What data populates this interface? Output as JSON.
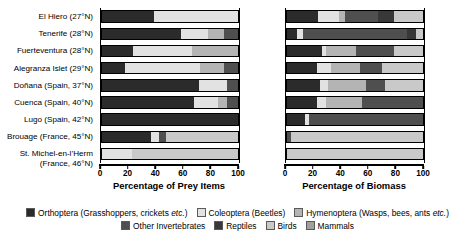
{
  "chart_data": {
    "type": "bar",
    "title": "",
    "subtitle": "",
    "orientation": "horizontal",
    "stacked": true,
    "normalized_percent": true,
    "grid": false,
    "legend_position": "bottom",
    "categories": [
      "El Hiero (27°N)",
      "Tenerife (28°N)",
      "Fuerteventura (28°N)",
      "Alegranza Islet (29°N)",
      "Doñana (Spain, 37°N)",
      "Cuenca (Spain, 40°N)",
      "Lugo (Spain, 42°N)",
      "Brouage (France, 45°N)",
      "St. Michel-en-l’Herm (France, 46°N)"
    ],
    "series_names": [
      "Orthoptera (Grasshoppers, crickets etc.)",
      "Coleoptera (Beetles)",
      "Hymenoptera (Wasps, bees, ants etc.)",
      "Other Invertebrates",
      "Reptiles",
      "Birds",
      "Mammals"
    ],
    "series_colors": [
      "#2b2b2b",
      "#e2e2e2",
      "#b4b4b4",
      "#4f4f4f",
      "#383838",
      "#c9c9c9",
      "#a0a0a0"
    ],
    "panels": [
      {
        "id": "prey-items",
        "xlabel": "Percentage of Prey Items",
        "xlim": [
          0,
          100
        ],
        "xticks": [
          0,
          20,
          40,
          60,
          80,
          100
        ],
        "rows": [
          {
            "category": "El Hiero (27°N)",
            "values": [
              38,
              62,
              0,
              0,
              0,
              0,
              0
            ]
          },
          {
            "category": "Tenerife (28°N)",
            "values": [
              58,
              20,
              12,
              10,
              0,
              0,
              0
            ]
          },
          {
            "category": "Fuerteventura (28°N)",
            "values": [
              23,
              43,
              34,
              0,
              0,
              0,
              0
            ]
          },
          {
            "category": "Alegranza Islet (29°N)",
            "values": [
              17,
              55,
              18,
              10,
              0,
              0,
              0
            ]
          },
          {
            "category": "Doñana (Spain, 37°N)",
            "values": [
              71,
              21,
              0,
              8,
              0,
              0,
              0
            ]
          },
          {
            "category": "Cuenca (Spain, 40°N)",
            "values": [
              68,
              17,
              7,
              8,
              0,
              0,
              0
            ]
          },
          {
            "category": "Lugo (Spain, 42°N)",
            "values": [
              100,
              0,
              0,
              0,
              0,
              0,
              0
            ]
          },
          {
            "category": "Brouage (France, 45°N)",
            "values": [
              36,
              6,
              0,
              5,
              0,
              53,
              0
            ]
          },
          {
            "category": "St. Michel-en-l’Herm (France, 46°N)",
            "values": [
              0,
              22,
              0,
              0,
              0,
              78,
              0
            ]
          }
        ]
      },
      {
        "id": "biomass",
        "xlabel": "Percentage of Biomass",
        "xlim": [
          0,
          100
        ],
        "xticks": [
          0,
          20,
          40,
          60,
          80,
          100
        ],
        "rows": [
          {
            "category": "El Hiero (27°N)",
            "values": [
              23,
              15,
              5,
              24,
              12,
              21,
              0
            ]
          },
          {
            "category": "Tenerife (28°N)",
            "values": [
              7,
              5,
              0,
              76,
              7,
              5,
              0
            ]
          },
          {
            "category": "Fuerteventura (28°N)",
            "values": [
              26,
              3,
              22,
              28,
              0,
              21,
              0
            ]
          },
          {
            "category": "Alegranza Islet (29°N)",
            "values": [
              22,
              10,
              22,
              16,
              0,
              30,
              0
            ]
          },
          {
            "category": "Doñana (Spain, 37°N)",
            "values": [
              24,
              6,
              28,
              14,
              0,
              28,
              0
            ]
          },
          {
            "category": "Cuenca (Spain, 40°N)",
            "values": [
              22,
              7,
              26,
              45,
              0,
              0,
              0
            ]
          },
          {
            "category": "Lugo (Spain, 42°N)",
            "values": [
              13,
              3,
              0,
              84,
              0,
              0,
              0
            ]
          },
          {
            "category": "Brouage (France, 45°N)",
            "values": [
              0,
              0,
              0,
              3,
              0,
              97,
              0
            ]
          },
          {
            "category": "St. Michel-en-l’Herm (France, 46°N)",
            "values": [
              0,
              0,
              0,
              0,
              0,
              100,
              0
            ]
          }
        ]
      }
    ]
  },
  "labels": {
    "rows": [
      {
        "line1": "El Hiero (27°N)",
        "line2": ""
      },
      {
        "line1": "Tenerife (28°N)",
        "line2": ""
      },
      {
        "line1": "Fuerteventura (28°N)",
        "line2": ""
      },
      {
        "line1": "Alegranza Islet (29°N)",
        "line2": ""
      },
      {
        "line1": "Doñana (Spain, 37°N)",
        "line2": ""
      },
      {
        "line1": "Cuenca (Spain, 40°N)",
        "line2": ""
      },
      {
        "line1": "Lugo (Spain, 42°N)",
        "line2": ""
      },
      {
        "line1": "Brouage (France, 45°N)",
        "line2": ""
      },
      {
        "line1": "St. Michel-en-l’Herm",
        "line2": "(France, 46°N)"
      }
    ]
  },
  "legend": {
    "row1": [
      {
        "label": "Orthoptera (Grasshoppers, crickets ",
        "italic": "etc.",
        "tail": ")",
        "color": "#2b2b2b"
      },
      {
        "label": "Coleoptera (Beetles)",
        "italic": "",
        "tail": "",
        "color": "#e2e2e2"
      },
      {
        "label": "Hymenoptera (Wasps, bees, ants ",
        "italic": "etc.",
        "tail": ")",
        "color": "#b4b4b4"
      }
    ],
    "row2": [
      {
        "label": "Other Invertebrates",
        "italic": "",
        "tail": "",
        "color": "#4f4f4f"
      },
      {
        "label": "Reptiles",
        "italic": "",
        "tail": "",
        "color": "#383838"
      },
      {
        "label": "Birds",
        "italic": "",
        "tail": "",
        "color": "#c9c9c9"
      },
      {
        "label": "Mammals",
        "italic": "",
        "tail": "",
        "color": "#a0a0a0"
      }
    ]
  }
}
